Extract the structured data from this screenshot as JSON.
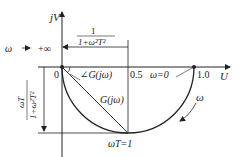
{
  "diagram": {
    "axes": {
      "vertical_label": "jV",
      "horizontal_label": "U",
      "origin_label": "0"
    },
    "ticks": {
      "half": "0.5",
      "one": "1.0"
    },
    "annotations": {
      "omega_inf": "ω→+∞",
      "omega_zero": "ω=0",
      "angle_label": "∠G(jω)",
      "magnitude_label": "G(jω)",
      "real_part_num": "1",
      "real_part_den": "1+ω²T²",
      "imag_part_num": "ωT",
      "imag_part_den": "1+ω²T²",
      "omega_T_one": "ωT=1",
      "direction_label": "ω"
    },
    "colors": {
      "line": "#222222",
      "background": "#ffffff"
    }
  }
}
